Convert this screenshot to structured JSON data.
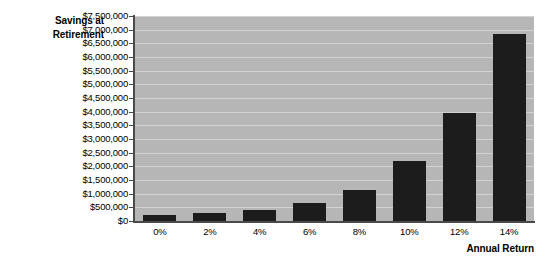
{
  "chart_data": {
    "type": "bar",
    "title": "",
    "xlabel": "Annual Return",
    "ylabel": "Savings at Retirement",
    "ylabel_line1": "Savings at",
    "ylabel_line2": "Retirement",
    "categories": [
      "0%",
      "2%",
      "4%",
      "6%",
      "8%",
      "10%",
      "12%",
      "14%"
    ],
    "values": [
      220000,
      300000,
      410000,
      660000,
      1150000,
      2200000,
      3950000,
      6850000
    ],
    "ylim": [
      0,
      7500000
    ],
    "ytick_values": [
      0,
      500000,
      1000000,
      1500000,
      2000000,
      2500000,
      3000000,
      3500000,
      4000000,
      4500000,
      5000000,
      5500000,
      6000000,
      6500000,
      7000000,
      7500000
    ],
    "ytick_labels": [
      "$0",
      "$500,000",
      "$1,000,000",
      "$1,500,000",
      "$2,000,000",
      "$2,500,000",
      "$3,000,000",
      "$3,500,000",
      "$4,000,000",
      "$4,500,000",
      "$5,000,000",
      "$5,500,000",
      "$6,000,000",
      "$6,500,000",
      "$7,000,000",
      "$7,500,000"
    ],
    "grid": true,
    "legend": false,
    "legend_position": "none",
    "colors": {
      "bar": "#1c1c1c",
      "plot_background": "#b6b6b6",
      "gridline": "#d2d2d2",
      "axis": "#4a4a4a",
      "text": "#000000",
      "page_background": "#ffffff"
    }
  }
}
